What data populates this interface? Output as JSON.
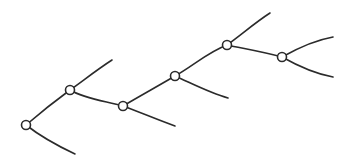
{
  "diagram": {
    "type": "tree",
    "colors": {
      "stroke": "#2b2b2b",
      "node_fill": "#ffffff",
      "background": "#ffffff"
    },
    "node_radius": 4.5,
    "nodes": [
      {
        "id": "A",
        "x": 26,
        "y": 125
      },
      {
        "id": "B",
        "x": 70,
        "y": 90
      },
      {
        "id": "C",
        "x": 123,
        "y": 106
      },
      {
        "id": "D",
        "x": 175,
        "y": 76
      },
      {
        "id": "E",
        "x": 227,
        "y": 45
      },
      {
        "id": "F",
        "x": 282,
        "y": 57
      }
    ],
    "leaves": [
      {
        "id": "L1",
        "x": 75,
        "y": 154
      },
      {
        "id": "L2",
        "x": 112,
        "y": 60
      },
      {
        "id": "L3",
        "x": 175,
        "y": 126
      },
      {
        "id": "L4",
        "x": 228,
        "y": 98
      },
      {
        "id": "L5",
        "x": 270,
        "y": 13
      },
      {
        "id": "L6",
        "x": 333,
        "y": 37
      },
      {
        "id": "L7",
        "x": 333,
        "y": 77
      }
    ],
    "edges": [
      {
        "from": "A",
        "to": "B",
        "path": "M26,125 C40,113 55,101 70,90"
      },
      {
        "from": "A",
        "to": "L1",
        "path": "M26,125 C40,136 58,146 75,154"
      },
      {
        "from": "B",
        "to": "L2",
        "path": "M70,90 C84,80 98,69 112,60"
      },
      {
        "from": "B",
        "to": "C",
        "path": "M70,90 C85,99 105,101 123,106"
      },
      {
        "from": "C",
        "to": "D",
        "path": "M123,106 C140,96 158,86 175,76"
      },
      {
        "from": "C",
        "to": "L3",
        "path": "M123,106 C142,113 158,120 175,126"
      },
      {
        "from": "D",
        "to": "E",
        "path": "M175,76 C193,66 208,52 227,45"
      },
      {
        "from": "D",
        "to": "L4",
        "path": "M175,76 C193,84 210,93 228,98"
      },
      {
        "from": "E",
        "to": "L5",
        "path": "M227,45 C242,34 256,22 270,13"
      },
      {
        "from": "E",
        "to": "F",
        "path": "M227,45 C246,49 264,52 282,57"
      },
      {
        "from": "F",
        "to": "L6",
        "path": "M282,57 C298,48 316,40 333,37"
      },
      {
        "from": "F",
        "to": "L7",
        "path": "M282,57 C298,66 316,74 333,77"
      }
    ]
  }
}
